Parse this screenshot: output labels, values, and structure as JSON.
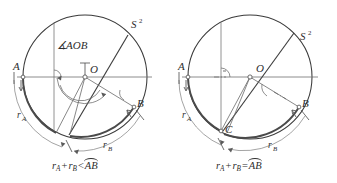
{
  "figure": {
    "panels": [
      {
        "id": "left",
        "sphere_label": "S",
        "sphere_exponent": "2",
        "angle_label": "AOB",
        "angle_symbol": "∡",
        "points": [
          {
            "name": "A",
            "label": "A"
          },
          {
            "name": "O",
            "label": "O"
          },
          {
            "name": "B",
            "label": "B"
          }
        ],
        "arc_labels": [
          {
            "name": "r-a",
            "base": "r",
            "sub": "A"
          },
          {
            "name": "r-b",
            "base": "r",
            "sub": "B"
          }
        ],
        "caption": {
          "r_a_base": "r",
          "r_a_sub": "A",
          "plus": "+",
          "r_b_base": "r",
          "r_b_sub": "B",
          "relation": "<",
          "arc": "AB"
        }
      },
      {
        "id": "right",
        "sphere_label": "S",
        "sphere_exponent": "2",
        "points": [
          {
            "name": "A",
            "label": "A"
          },
          {
            "name": "O",
            "label": "O"
          },
          {
            "name": "B",
            "label": "B"
          },
          {
            "name": "C",
            "label": "C"
          }
        ],
        "arc_labels": [
          {
            "name": "r-a",
            "base": "r",
            "sub": "A"
          },
          {
            "name": "r-b",
            "base": "r",
            "sub": "B"
          }
        ],
        "caption": {
          "r_a_base": "r",
          "r_a_sub": "A",
          "plus": "+",
          "r_b_base": "r",
          "r_b_sub": "B",
          "relation": "=",
          "arc": "AB"
        }
      }
    ],
    "colors": {
      "ink": "#2e2e2e",
      "stroke": "#3a3a3a",
      "light_stroke": "#7d7d7d",
      "background": "#ffffff"
    }
  }
}
